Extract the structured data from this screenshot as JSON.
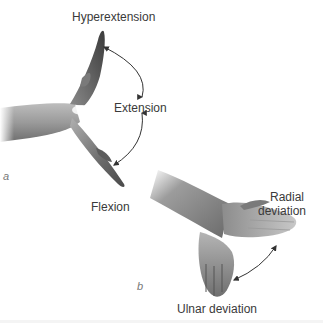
{
  "figure": {
    "panel_a": {
      "letter": "a",
      "labels": {
        "hyperextension": "Hyperextension",
        "extension": "Extension",
        "flexion": "Flexion"
      }
    },
    "panel_b": {
      "letter": "b",
      "labels": {
        "radial_line1": "Radial",
        "radial_line2": "deviation",
        "ulnar": "Ulnar deviation"
      }
    },
    "colors": {
      "skin_light": "#e6e6e6",
      "skin_mid": "#a8a8a8",
      "skin_dark": "#555555",
      "arrow": "#333333",
      "text": "#3a3a3a"
    }
  }
}
